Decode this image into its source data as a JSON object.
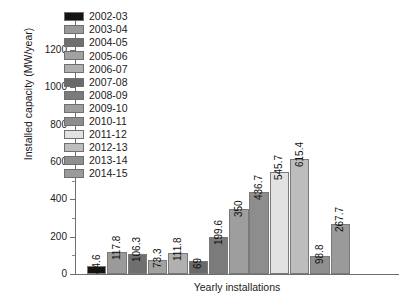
{
  "chart_data": {
    "type": "bar",
    "title": "",
    "xlabel": "Yearly installations",
    "ylabel": "Installed capacity (MW/year)",
    "categories": [
      "2002-03",
      "2003-04",
      "2004-05",
      "2005-06",
      "2006-07",
      "2007-08",
      "2008-09",
      "2009-10",
      "2010-11",
      "2011-12",
      "2012-13",
      "2013-14",
      "2014-15"
    ],
    "values": [
      44.6,
      117.8,
      106.3,
      73.3,
      111.8,
      69,
      199.6,
      350,
      436.7,
      545.7,
      615.4,
      98.8,
      267.7
    ],
    "value_labels": [
      "44.6",
      "117.8",
      "106.3",
      "73.3",
      "111.8",
      "69",
      "199.6",
      "350",
      "436.7",
      "545.7",
      "615.4",
      "98.8",
      "267.7"
    ],
    "colors": [
      "#141414",
      "#9a9a9a",
      "#6f6f6f",
      "#a2a2a2",
      "#b0b0b0",
      "#6a6a6a",
      "#7b7b7b",
      "#9e9e9e",
      "#8d8d8d",
      "#e2e2e2",
      "#bdbdbd",
      "#8f8f8f",
      "#9a9a9a"
    ],
    "ylim": [
      0,
      1200
    ],
    "ytick_labels": [
      "0",
      "200",
      "400",
      "600",
      "800",
      "1000",
      "1200"
    ],
    "ytick_values": [
      0,
      200,
      400,
      600,
      800,
      1000,
      1200
    ],
    "yminor_values": [
      100,
      300,
      500,
      700,
      900,
      1100
    ],
    "xtick_labels": [],
    "grid": false,
    "legend_position": "upper-left-inside"
  },
  "legend": {
    "entries": [
      {
        "label": "2002-03",
        "color": "#141414"
      },
      {
        "label": "2003-04",
        "color": "#9a9a9a"
      },
      {
        "label": "2004-05",
        "color": "#6f6f6f"
      },
      {
        "label": "2005-06",
        "color": "#a2a2a2"
      },
      {
        "label": "2006-07",
        "color": "#b0b0b0"
      },
      {
        "label": "2007-08",
        "color": "#6a6a6a"
      },
      {
        "label": "2008-09",
        "color": "#7b7b7b"
      },
      {
        "label": "2009-10",
        "color": "#9e9e9e"
      },
      {
        "label": "2010-11",
        "color": "#8d8d8d"
      },
      {
        "label": "2011-12",
        "color": "#e2e2e2"
      },
      {
        "label": "2012-13",
        "color": "#bdbdbd"
      },
      {
        "label": "2013-14",
        "color": "#8f8f8f"
      },
      {
        "label": "2014-15",
        "color": "#9a9a9a"
      }
    ]
  }
}
